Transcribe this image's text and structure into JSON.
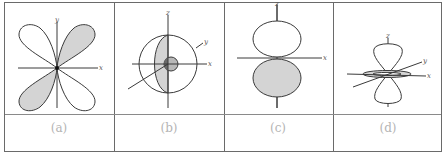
{
  "figure": {
    "panels": [
      {
        "id": "a",
        "label": "(a)",
        "axes": [
          "x",
          "y"
        ],
        "description": "four-lobed orbital, lobes along diagonals, top-right and bottom-left shaded"
      },
      {
        "id": "b",
        "label": "(b)",
        "axes": [
          "x",
          "y",
          "z"
        ],
        "description": "spherical orbital with shaded cutaway half and small shaded inner sphere"
      },
      {
        "id": "c",
        "label": "(c)",
        "axes": [
          "x",
          "z"
        ],
        "description": "two-lobed orbital along z, upper lobe white, lower lobe shaded"
      },
      {
        "id": "d",
        "label": "(d)",
        "axes": [
          "x",
          "y",
          "z"
        ],
        "description": "two-lobed orbital along z with small torus ring in xy-plane"
      }
    ],
    "colors": {
      "line": "#3a3a3a",
      "shade": "#d4d4d4",
      "dark_shade": "#9a9a9a",
      "grid": "#6a6a6a",
      "label": "#b4b4b4"
    }
  }
}
